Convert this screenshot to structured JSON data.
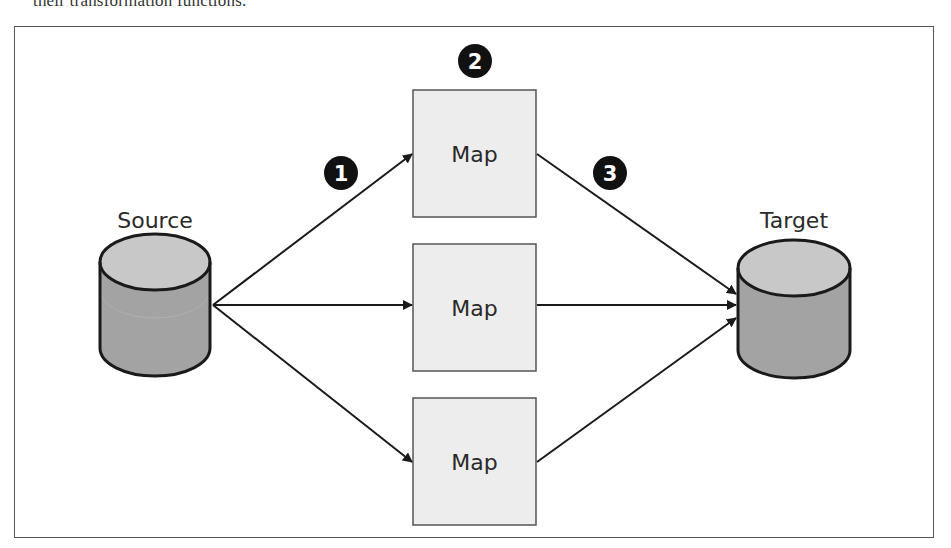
{
  "caption_fragment": "their transformation functions.",
  "diagram": {
    "source": {
      "label": "Source"
    },
    "target": {
      "label": "Target"
    },
    "map_boxes": [
      {
        "label": "Map"
      },
      {
        "label": "Map"
      },
      {
        "label": "Map"
      }
    ],
    "callouts": [
      {
        "number": "1",
        "meaning": "source to map"
      },
      {
        "number": "2",
        "meaning": "map function"
      },
      {
        "number": "3",
        "meaning": "map to target"
      }
    ],
    "colors": {
      "frame": "#555555",
      "box_fill": "#ededed",
      "box_stroke": "#555555",
      "cylinder_top": "#c4c4c4",
      "cylinder_body": "#a3a3a3",
      "callout_fill": "#111111",
      "arrow": "#1a1a1a"
    }
  }
}
